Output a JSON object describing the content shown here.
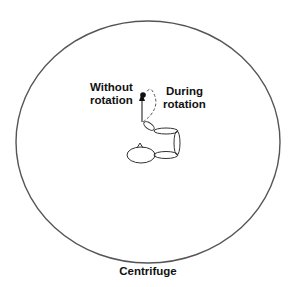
{
  "labels": {
    "without": [
      "Without",
      "rotation"
    ],
    "during": [
      "During",
      "rotation"
    ],
    "centrifuge": "Centrifuge"
  },
  "colors": {
    "stroke": "#333333",
    "text": "#111111",
    "background": "#ffffff"
  }
}
